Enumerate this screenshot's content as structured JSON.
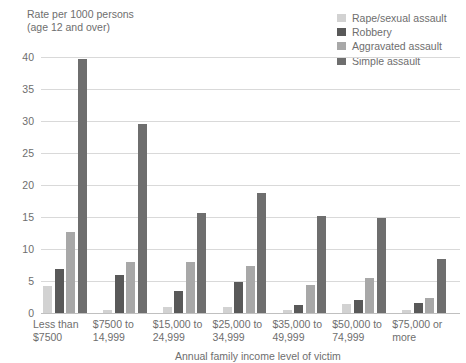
{
  "chart_data": {
    "type": "bar",
    "title": "",
    "ylabel": "Rate per 1000 persons\n(age 12 and over)",
    "xlabel": "Annual family income level of victim",
    "ylim": [
      0,
      40
    ],
    "yticks": [
      0,
      5,
      10,
      15,
      20,
      25,
      30,
      35,
      40
    ],
    "grid": true,
    "legend_position": "top-right",
    "categories": [
      "Less than\n$7500",
      "$7500 to\n14,999",
      "$15,000 to\n24,999",
      "$25,000 to\n34,999",
      "$35,000 to\n49,999",
      "$50,000 to\n74,999",
      "$75,000 or\nmore"
    ],
    "series": [
      {
        "name": "Rape/sexual assault",
        "color": "#d2d2d2",
        "values": [
          4.2,
          0.4,
          0.9,
          1.0,
          0.4,
          1.4,
          0.4
        ]
      },
      {
        "name": "Robbery",
        "color": "#595959",
        "values": [
          6.8,
          6.0,
          3.4,
          4.8,
          1.3,
          2.0,
          1.5
        ]
      },
      {
        "name": "Aggravated assault",
        "color": "#a8a8a8",
        "values": [
          12.7,
          7.9,
          8.0,
          7.3,
          4.3,
          5.4,
          2.4
        ]
      },
      {
        "name": "Simple assault",
        "color": "#6e6e6e",
        "values": [
          39.7,
          29.5,
          15.7,
          18.7,
          15.1,
          14.9,
          8.4
        ]
      }
    ]
  }
}
